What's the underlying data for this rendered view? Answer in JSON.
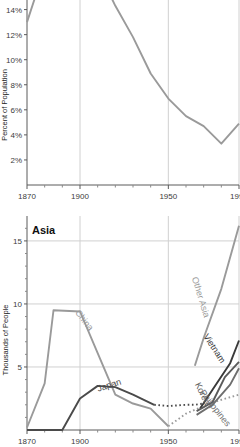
{
  "colors": {
    "light_gray_line": "#9a9a9a",
    "dark_gray_line": "#4a4a4a",
    "mid_gray_line": "#6e6e6e",
    "axis": "#5a5a5a",
    "grid": "#d0d0d0",
    "text": "#3c3c3c",
    "title_text": "#101010"
  },
  "chart_data": [
    {
      "id": "top",
      "type": "line",
      "title": "",
      "xlabel": "",
      "ylabel": "Percent of Population",
      "xlim": [
        1870,
        1990
      ],
      "ylim": [
        0,
        17
      ],
      "grid": true,
      "legend": "none",
      "xticks": [
        1870,
        1900,
        1950,
        1990
      ],
      "xticklabels": [
        "1870",
        "1900",
        "1950",
        "1990"
      ],
      "xminorticks": [
        1880,
        1890,
        1910,
        1920,
        1930,
        1940,
        1960,
        1970,
        1980
      ],
      "yticks": [
        2,
        4,
        6,
        8,
        10,
        12,
        14,
        16
      ],
      "yticklabels": [
        "2%",
        "4%",
        "6%",
        "8%",
        "10%",
        "12%",
        "14%",
        "16%"
      ],
      "series": [
        {
          "name": "Percent of Population",
          "color": "#9a9a9a",
          "x": [
            1870,
            1880,
            1890,
            1900,
            1910,
            1920,
            1930,
            1940,
            1950,
            1960,
            1970,
            1980,
            1990
          ],
          "y": [
            13.0,
            17.3,
            17.5,
            16.0,
            17.2,
            14.3,
            11.8,
            8.9,
            6.9,
            5.5,
            4.7,
            3.3,
            4.9
          ]
        }
      ]
    },
    {
      "id": "bottom",
      "type": "line",
      "title": "Asia",
      "xlabel": "",
      "ylabel": "Thousands of People",
      "xlim": [
        1870,
        1990
      ],
      "ylim": [
        0,
        16.5
      ],
      "grid": true,
      "legend": "inline-labels",
      "xticks": [
        1870,
        1900,
        1950,
        1990
      ],
      "xticklabels": [
        "1870",
        "1900",
        "1950",
        "1990"
      ],
      "xminorticks": [
        1880,
        1890,
        1910,
        1920,
        1930,
        1940,
        1960,
        1970,
        1980
      ],
      "yticks": [
        5,
        10,
        15
      ],
      "yticklabels": [
        "5",
        "10",
        "15"
      ],
      "series": [
        {
          "name": "China",
          "label": "China",
          "color": "#9a9a9a",
          "style": "solid-then-dotted",
          "x": [
            1870,
            1880,
            1885,
            1900,
            1910,
            1920,
            1930,
            1940,
            1950,
            1960,
            1965,
            1970,
            1980,
            1990
          ],
          "y": [
            0.2,
            3.7,
            9.5,
            9.4,
            6.1,
            2.8,
            2.1,
            1.7,
            0.3,
            1.3,
            1.6,
            1.9,
            2.4,
            2.8
          ],
          "dotted_from": 1950
        },
        {
          "name": "Japan",
          "label": "Japan",
          "color": "#4a4a4a",
          "style": "solid-then-dotted",
          "x": [
            1870,
            1890,
            1900,
            1910,
            1920,
            1930,
            1942,
            1950,
            1960,
            1965,
            1970
          ],
          "y": [
            0.0,
            0.0,
            2.5,
            3.5,
            3.4,
            2.8,
            2.0,
            1.9,
            2.0,
            2.0,
            2.1
          ],
          "dotted_from": 1942
        },
        {
          "name": "Other Asia",
          "label": "Other Asia",
          "color": "#9a9a9a",
          "style": "solid",
          "x": [
            1965,
            1970,
            1980,
            1990
          ],
          "y": [
            5.1,
            7.3,
            11.2,
            16.2
          ]
        },
        {
          "name": "Vietnam",
          "label": "Vietnam",
          "color": "#3a3a3a",
          "style": "solid",
          "x": [
            1968,
            1975,
            1985,
            1990
          ],
          "y": [
            1.7,
            3.2,
            5.3,
            7.1
          ]
        },
        {
          "name": "Korea",
          "label": "Korea",
          "color": "#5a5a5a",
          "style": "solid",
          "x": [
            1966,
            1975,
            1982,
            1990
          ],
          "y": [
            1.5,
            2.2,
            4.2,
            5.4
          ]
        },
        {
          "name": "Philippines",
          "label": "Philippines",
          "color": "#6e6e6e",
          "style": "solid",
          "x": [
            1966,
            1975,
            1985,
            1990
          ],
          "y": [
            1.2,
            2.0,
            3.6,
            4.9
          ]
        }
      ]
    }
  ]
}
